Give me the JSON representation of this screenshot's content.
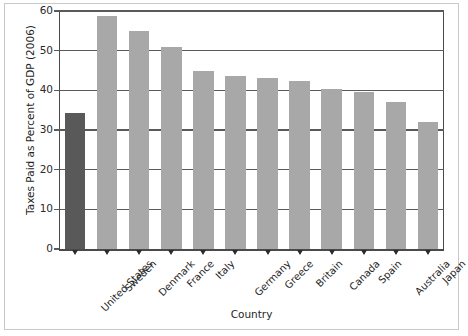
{
  "chart_data": {
    "type": "bar",
    "title": "",
    "xlabel": "Country",
    "ylabel": "Taxes Paid as Percent of GDP (2006)",
    "categories": [
      "United States",
      "Sweden",
      "Denmark",
      "France",
      "Italy",
      "Germany",
      "Greece",
      "Britain",
      "Canada",
      "Spain",
      "Australia",
      "Japan"
    ],
    "values": [
      34.3,
      58.8,
      55.0,
      51.0,
      45.0,
      43.5,
      43.0,
      42.3,
      40.3,
      39.5,
      37.0,
      32.0
    ],
    "ylim": [
      0,
      60
    ],
    "yticks": [
      0,
      10,
      20,
      30,
      40,
      50,
      60
    ],
    "ytick_labels": [
      "0",
      "10",
      "20",
      "30",
      "40",
      "50",
      "60"
    ],
    "grid": "horizontal",
    "legend": "none",
    "highlight_index": 0,
    "colors": {
      "bar_default": "#a8a8a8",
      "bar_highlight": "#595959",
      "axis": "#4a4a4a",
      "grid": "#5a5a5a",
      "text": "#1f1f1f",
      "outer_frame": "#c9c9c9",
      "background": "#ffffff"
    }
  }
}
